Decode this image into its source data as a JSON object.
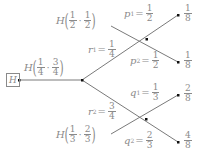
{
  "diagram": {
    "root_label": "H",
    "entropy_labels": {
      "top": {
        "symbol": "H",
        "a_num": "1",
        "a_den": "2",
        "b_num": "1",
        "b_den": "2"
      },
      "middle": {
        "symbol": "H",
        "a_num": "1",
        "a_den": "4",
        "b_num": "3",
        "b_den": "4"
      },
      "bottom": {
        "symbol": "H",
        "a_num": "1",
        "a_den": "3",
        "b_num": "2",
        "b_den": "3"
      }
    },
    "branches": {
      "r1": {
        "var": "r",
        "sub": "1",
        "num": "1",
        "den": "4"
      },
      "r2": {
        "var": "r",
        "sub": "2",
        "num": "3",
        "den": "4"
      },
      "p1": {
        "var": "p",
        "sub": "1",
        "num": "1",
        "den": "2"
      },
      "p2": {
        "var": "p",
        "sub": "2",
        "num": "1",
        "den": "2"
      },
      "q1": {
        "var": "q",
        "sub": "1",
        "num": "1",
        "den": "3"
      },
      "q2": {
        "var": "q",
        "sub": "2",
        "num": "2",
        "den": "3"
      }
    },
    "leaves": [
      {
        "num": "1",
        "den": "8"
      },
      {
        "num": "1",
        "den": "8"
      },
      {
        "num": "2",
        "den": "8"
      },
      {
        "num": "4",
        "den": "8"
      }
    ],
    "colors": {
      "line": "#7a7a7a",
      "node": "#111111",
      "text": "#8a8a8a"
    }
  }
}
